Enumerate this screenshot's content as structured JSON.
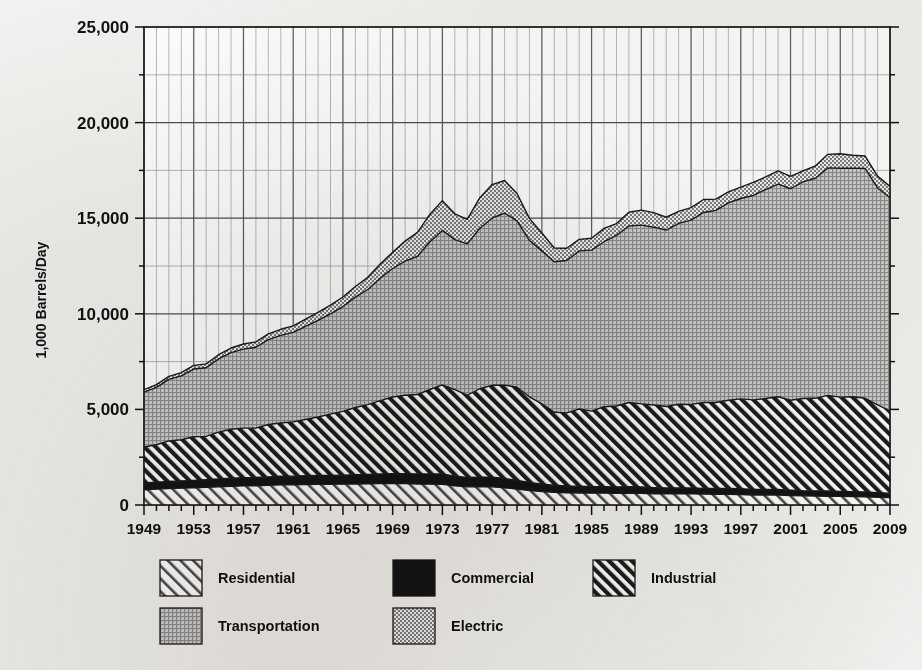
{
  "chart_data": {
    "type": "area",
    "stacked": true,
    "title": "",
    "subtitle": "",
    "xlabel": "",
    "ylabel": "1,000 Barrels/Day",
    "xlim": [
      1949,
      2009
    ],
    "ylim": [
      0,
      25000
    ],
    "grid": true,
    "legend_position": "bottom",
    "y_ticks": [
      0,
      5000,
      10000,
      15000,
      20000,
      25000
    ],
    "y_tick_labels": [
      "0",
      "5,000",
      "10,000",
      "15,000",
      "20,000",
      "25,000"
    ],
    "y_minor_step": 2500,
    "x_ticks": [
      1949,
      1953,
      1957,
      1961,
      1965,
      1969,
      1973,
      1977,
      1981,
      1985,
      1989,
      1993,
      1997,
      2001,
      2005,
      2009
    ],
    "x_tick_labels": [
      "1949",
      "1953",
      "1957",
      "1961",
      "1965",
      "1969",
      "1973",
      "1977",
      "1981",
      "1985",
      "1989",
      "1993",
      "1997",
      "2001",
      "2005",
      "2009"
    ],
    "x_minor_step": 1,
    "x": [
      1949,
      1950,
      1951,
      1952,
      1953,
      1954,
      1955,
      1956,
      1957,
      1958,
      1959,
      1960,
      1961,
      1962,
      1963,
      1964,
      1965,
      1966,
      1967,
      1968,
      1969,
      1970,
      1971,
      1972,
      1973,
      1974,
      1975,
      1976,
      1977,
      1978,
      1979,
      1980,
      1981,
      1982,
      1983,
      1984,
      1985,
      1986,
      1987,
      1988,
      1989,
      1990,
      1991,
      1992,
      1993,
      1994,
      1995,
      1996,
      1997,
      1998,
      1999,
      2000,
      2001,
      2002,
      2003,
      2004,
      2005,
      2006,
      2007,
      2008,
      2009
    ],
    "series": [
      {
        "name": "Residential",
        "pattern": "light-diagonal-hatch",
        "color": "#ffffff",
        "values": [
          800,
          830,
          860,
          880,
          900,
          920,
          950,
          980,
          1000,
          1010,
          1030,
          1050,
          1060,
          1070,
          1080,
          1080,
          1090,
          1100,
          1110,
          1120,
          1130,
          1120,
          1100,
          1090,
          1080,
          1000,
          950,
          960,
          950,
          900,
          830,
          760,
          700,
          660,
          640,
          630,
          620,
          620,
          610,
          620,
          610,
          590,
          580,
          580,
          580,
          570,
          560,
          560,
          550,
          520,
          520,
          520,
          500,
          480,
          470,
          460,
          450,
          440,
          430,
          400,
          390
        ]
      },
      {
        "name": "Commercial",
        "pattern": "solid-black",
        "color": "#141414",
        "values": [
          350,
          360,
          370,
          380,
          390,
          400,
          410,
          420,
          430,
          430,
          440,
          450,
          450,
          460,
          460,
          470,
          470,
          480,
          490,
          500,
          510,
          520,
          520,
          530,
          540,
          510,
          490,
          500,
          510,
          490,
          450,
          420,
          390,
          370,
          350,
          350,
          340,
          340,
          330,
          340,
          330,
          320,
          310,
          310,
          310,
          300,
          300,
          300,
          300,
          290,
          290,
          290,
          280,
          270,
          270,
          270,
          260,
          260,
          250,
          240,
          230
        ]
      },
      {
        "name": "Industrial",
        "pattern": "dark-diagonal-hatch",
        "color": "#ffffff",
        "values": [
          1880,
          1960,
          2120,
          2150,
          2280,
          2270,
          2450,
          2560,
          2590,
          2580,
          2740,
          2790,
          2840,
          2940,
          3060,
          3200,
          3340,
          3520,
          3650,
          3840,
          4010,
          4100,
          4160,
          4420,
          4660,
          4520,
          4300,
          4620,
          4800,
          4880,
          4880,
          4480,
          4200,
          3820,
          3830,
          4040,
          3950,
          4180,
          4240,
          4400,
          4350,
          4320,
          4260,
          4380,
          4370,
          4490,
          4500,
          4620,
          4700,
          4690,
          4760,
          4850,
          4700,
          4820,
          4840,
          5000,
          4930,
          4960,
          4900,
          4600,
          4300
        ]
      },
      {
        "name": "Transportation",
        "pattern": "gray-crosshatch",
        "color": "#b6b6b6",
        "values": [
          2870,
          3000,
          3220,
          3340,
          3540,
          3590,
          3830,
          4010,
          4130,
          4230,
          4440,
          4580,
          4680,
          4870,
          5060,
          5250,
          5480,
          5770,
          6020,
          6400,
          6720,
          7010,
          7230,
          7730,
          8080,
          7850,
          7920,
          8380,
          8750,
          9000,
          8700,
          8180,
          8000,
          7870,
          7970,
          8270,
          8420,
          8630,
          8920,
          9230,
          9350,
          9300,
          9230,
          9460,
          9640,
          9940,
          10050,
          10320,
          10480,
          10690,
          10930,
          11120,
          11060,
          11330,
          11510,
          11900,
          11970,
          11960,
          12020,
          11340,
          11160
        ]
      },
      {
        "name": "Electric",
        "pattern": "light-dot",
        "color": "#dcdcdc",
        "values": [
          130,
          150,
          160,
          170,
          190,
          200,
          220,
          240,
          270,
          280,
          300,
          320,
          340,
          380,
          410,
          450,
          500,
          560,
          640,
          740,
          850,
          1050,
          1250,
          1440,
          1560,
          1350,
          1280,
          1600,
          1750,
          1700,
          1430,
          1150,
          940,
          720,
          640,
          600,
          620,
          700,
          620,
          720,
          780,
          760,
          670,
          630,
          650,
          680,
          590,
          580,
          600,
          680,
          660,
          700,
          650,
          580,
          640,
          710,
          760,
          670,
          650,
          620,
          580
        ]
      }
    ],
    "totals_note": "Stacked totals peak near 20,700 around 2005 and near 18,600 around 1978."
  },
  "legend": {
    "entries": [
      {
        "label": "Residential",
        "swatch": "light-diagonal-hatch"
      },
      {
        "label": "Commercial",
        "swatch": "solid-black"
      },
      {
        "label": "Industrial",
        "swatch": "dark-diagonal-hatch"
      },
      {
        "label": "Transportation",
        "swatch": "gray-crosshatch"
      },
      {
        "label": "Electric",
        "swatch": "light-dot"
      }
    ]
  }
}
